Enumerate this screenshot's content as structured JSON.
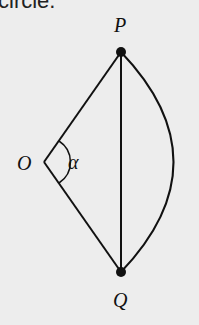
{
  "caption": "circle.",
  "diagram": {
    "points": {
      "P": {
        "label": "P",
        "x": 121,
        "y": 52
      },
      "Q": {
        "label": "Q",
        "x": 121,
        "y": 272
      },
      "O": {
        "label": "O",
        "x": 44,
        "y": 162
      }
    },
    "angle_label": "α",
    "segments": [
      "OP",
      "OQ",
      "PQ"
    ],
    "arc": "PQ"
  }
}
